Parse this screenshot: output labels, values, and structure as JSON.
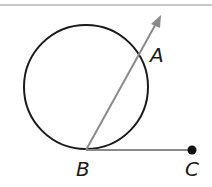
{
  "diagram": {
    "type": "geometry",
    "colors": {
      "circle": "#1a1a1a",
      "ray": "#8a8a8a",
      "segment": "#8a8a8a",
      "point": "#111111",
      "top_rule": "#b5b5b5"
    },
    "points": {
      "A": {
        "label": "A"
      },
      "B": {
        "label": "B"
      },
      "C": {
        "label": "C"
      }
    },
    "elements": [
      "circle",
      "ray BA",
      "segment BC",
      "point C"
    ]
  }
}
